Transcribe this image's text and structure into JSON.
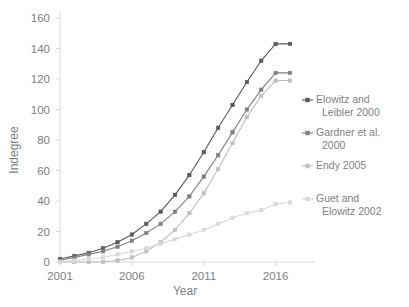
{
  "chart_data": {
    "type": "line",
    "title": "",
    "xlabel": "Year",
    "ylabel": "Indegree",
    "xlim": [
      2001,
      2017
    ],
    "ylim": [
      0,
      160
    ],
    "ytick_step": 20,
    "yticks": [
      0,
      20,
      40,
      60,
      80,
      100,
      120,
      140,
      160
    ],
    "xticks": [
      2001,
      2006,
      2011,
      2016
    ],
    "x": [
      2001,
      2002,
      2003,
      2004,
      2005,
      2006,
      2007,
      2008,
      2009,
      2010,
      2011,
      2012,
      2013,
      2014,
      2015,
      2016,
      2017
    ],
    "grid": false,
    "legend_position": "right",
    "series": [
      {
        "name": "Elowitz and Leibler 2000",
        "color": "#595959",
        "marker": "square",
        "values": [
          2,
          4,
          6,
          9,
          13,
          18,
          25,
          33,
          44,
          57,
          72,
          88,
          103,
          118,
          132,
          143,
          143
        ]
      },
      {
        "name": "Gardner et al. 2000",
        "color": "#808080",
        "marker": "square",
        "values": [
          1,
          3,
          5,
          7,
          10,
          14,
          19,
          25,
          33,
          43,
          56,
          70,
          85,
          100,
          113,
          124,
          124
        ]
      },
      {
        "name": "Endy 2005",
        "color": "#bfbfbf",
        "marker": "square",
        "values": [
          0,
          0,
          0,
          0,
          1,
          3,
          7,
          13,
          21,
          32,
          45,
          61,
          78,
          95,
          109,
          119,
          119
        ]
      },
      {
        "name": "Guet and Elowitz 2002",
        "color": "#d9d9d9",
        "marker": "square",
        "values": [
          0,
          1,
          2,
          3,
          5,
          7,
          9,
          12,
          15,
          18,
          21,
          25,
          29,
          32,
          34,
          38,
          39
        ]
      }
    ]
  },
  "legend": {
    "items": [
      {
        "label_line1": "Elowitz and",
        "label_line2": "Leibler 2000"
      },
      {
        "label_line1": "Gardner et al.",
        "label_line2": "2000"
      },
      {
        "label_line1": "Endy 2005",
        "label_line2": ""
      },
      {
        "label_line1": "Guet and",
        "label_line2": "Elowitz 2002"
      }
    ]
  }
}
